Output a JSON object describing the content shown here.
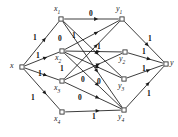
{
  "figure": {
    "width": 178,
    "height": 137,
    "background": "#ffffff",
    "stroke_color": "#1a1a1a",
    "node_fill": "#ffffff"
  },
  "nodes": [
    {
      "id": "x",
      "label": "x",
      "sub": "",
      "cx": 22,
      "cy": 67,
      "label_x": 10,
      "label_y": 62
    },
    {
      "id": "x1",
      "label": "x",
      "sub": "1",
      "cx": 61,
      "cy": 19,
      "label_x": 54,
      "label_y": 5
    },
    {
      "id": "x2",
      "label": "x",
      "sub": "2",
      "cx": 62,
      "cy": 51,
      "label_x": 55,
      "label_y": 54
    },
    {
      "id": "x3",
      "label": "x",
      "sub": "3",
      "cx": 62,
      "cy": 81,
      "label_x": 54,
      "label_y": 84
    },
    {
      "id": "x4",
      "label": "x",
      "sub": "4",
      "cx": 62,
      "cy": 112,
      "label_x": 54,
      "label_y": 115
    },
    {
      "id": "y1",
      "label": "y",
      "sub": "1",
      "cx": 122,
      "cy": 19,
      "label_x": 116,
      "label_y": 5
    },
    {
      "id": "y2",
      "label": "y",
      "sub": "2",
      "cx": 125,
      "cy": 52,
      "label_x": 119,
      "label_y": 55
    },
    {
      "id": "y3",
      "label": "y",
      "sub": "3",
      "cx": 124,
      "cy": 79,
      "label_x": 118,
      "label_y": 82
    },
    {
      "id": "y4",
      "label": "y",
      "sub": "4",
      "cx": 124,
      "cy": 110,
      "label_x": 118,
      "label_y": 113
    },
    {
      "id": "y",
      "label": "y",
      "sub": "",
      "cx": 166,
      "cy": 64,
      "label_x": 170,
      "label_y": 59
    }
  ],
  "edges": [
    {
      "from": "x",
      "to": "x1",
      "label": "1",
      "label_x": 33,
      "label_y": 34
    },
    {
      "from": "x",
      "to": "x2",
      "label": "1",
      "label_x": 36,
      "label_y": 52
    },
    {
      "from": "x",
      "to": "x3",
      "label": "1",
      "label_x": 38,
      "label_y": 70
    },
    {
      "from": "x",
      "to": "x4",
      "label": "1",
      "label_x": 31,
      "label_y": 94
    },
    {
      "from": "x1",
      "to": "y1",
      "label": "0",
      "label_x": 89,
      "label_y": 10
    },
    {
      "from": "x1",
      "to": "y3",
      "label": "",
      "label_x": 0,
      "label_y": 0
    },
    {
      "from": "x1",
      "to": "y4",
      "label": "",
      "label_x": 0,
      "label_y": 0
    },
    {
      "from": "x2",
      "to": "y1",
      "label": "0",
      "label_x": 58,
      "label_y": 35
    },
    {
      "from": "x2",
      "to": "y2",
      "label": "1",
      "label_x": 97,
      "label_y": 43
    },
    {
      "from": "x2",
      "to": "y3",
      "label": "0",
      "label_x": 81,
      "label_y": 76
    },
    {
      "from": "x2",
      "to": "y4",
      "label": "0",
      "label_x": 97,
      "label_y": 78
    },
    {
      "from": "x3",
      "to": "y1",
      "label": "1",
      "label_x": 72,
      "label_y": 32
    },
    {
      "from": "x3",
      "to": "y2",
      "label": "1",
      "label_x": 60,
      "label_y": 65
    },
    {
      "from": "x3",
      "to": "y4",
      "label": "0",
      "label_x": 78,
      "label_y": 94
    },
    {
      "from": "x4",
      "to": "y4",
      "label": "1",
      "label_x": 92,
      "label_y": 113
    },
    {
      "from": "y1",
      "to": "y",
      "label": "1",
      "label_x": 148,
      "label_y": 35
    },
    {
      "from": "y2",
      "to": "y",
      "label": "1",
      "label_x": 142,
      "label_y": 48
    },
    {
      "from": "y3",
      "to": "y",
      "label": "1",
      "label_x": 142,
      "label_y": 65
    },
    {
      "from": "y4",
      "to": "y",
      "label": "1",
      "label_x": 147,
      "label_y": 90
    }
  ]
}
